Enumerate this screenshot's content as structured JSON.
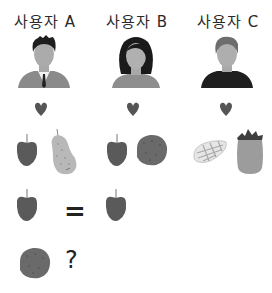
{
  "users": [
    {
      "label": "사용자 A",
      "avatar": "man-suit-avatar",
      "liked_fruits": [
        "apple",
        "pear"
      ]
    },
    {
      "label": "사용자 B",
      "avatar": "woman-avatar",
      "liked_fruits": [
        "apple",
        "melon"
      ]
    },
    {
      "label": "사용자 C",
      "avatar": "man-casual-avatar",
      "liked_fruits": [
        "mango",
        "pineapple"
      ]
    }
  ],
  "preference_icon": "heart-icon",
  "comparison": {
    "left": "apple",
    "operator": "=",
    "right": "apple"
  },
  "question": {
    "fruit": "melon",
    "symbol": "?"
  },
  "colors": {
    "background": "#ffffff",
    "apple": "#5a5a5a",
    "pear": "#b8b8b8",
    "melon": "#6a6a6a",
    "heart": "#555555",
    "text": "#2a2a2a"
  }
}
